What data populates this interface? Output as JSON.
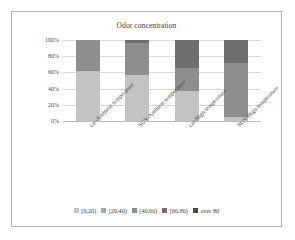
{
  "chart_data": {
    "type": "bar",
    "stacked": true,
    "normalized": "percent",
    "title": "Odor concentration",
    "xlabel": "",
    "ylabel": "",
    "ylim": [
      0,
      100
    ],
    "yticks": [
      "0%",
      "20%",
      "40%",
      "60%",
      "80%",
      "100%"
    ],
    "ytick_values": [
      0,
      20,
      40,
      60,
      80,
      100
    ],
    "grid": true,
    "legend_position": "bottom",
    "categories": [
      "car-Ambient temperature",
      "SUV-Ambient temperature",
      "car-High temperature",
      "SUV-High temperature"
    ],
    "series": [
      {
        "name": "[0,20)",
        "color": "#c3c3c3",
        "values": [
          62,
          57,
          37,
          5
        ]
      },
      {
        "name": "[20,40)",
        "color": "#a8a8a8",
        "values": [
          0,
          0,
          0,
          0
        ]
      },
      {
        "name": "[40,60)",
        "color": "#8e8e8e",
        "values": [
          38,
          39,
          29,
          67
        ]
      },
      {
        "name": "[60,80)",
        "color": "#6f6f6f",
        "values": [
          0,
          4,
          34,
          28
        ]
      },
      {
        "name": "over 80",
        "color": "#4a4a4a",
        "values": [
          0,
          0,
          0,
          0
        ]
      }
    ]
  },
  "legend": {
    "items": [
      {
        "label": "[0,20)",
        "color": "#c3c3c3"
      },
      {
        "label": "[20,40)",
        "color": "#a8a8a8"
      },
      {
        "label": "[40,60)",
        "color": "#8e8e8e"
      },
      {
        "label": "[60,80)",
        "color": "#6f6f6f"
      },
      {
        "label": "over 80",
        "color": "#4a4a4a"
      }
    ]
  },
  "frame": {
    "border_color": "#b4b4b4",
    "background": "#ffffff"
  }
}
